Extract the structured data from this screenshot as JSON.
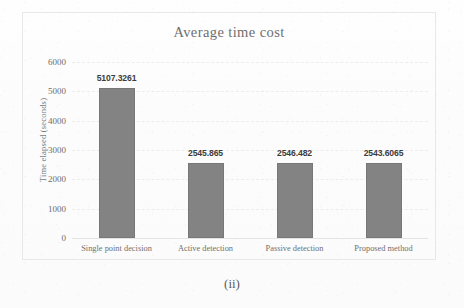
{
  "figure": {
    "caption": "(ii)"
  },
  "chart_data": {
    "type": "bar",
    "title": "Average time cost",
    "xlabel": "",
    "ylabel": "Time elapsed (seconds)",
    "categories": [
      "Single point decision",
      "Active detection",
      "Passive detection",
      "Proposed method"
    ],
    "values": [
      5107.3261,
      2545.865,
      2546.482,
      2543.6065
    ],
    "value_labels": [
      "5107.3261",
      "2545.865",
      "2546.482",
      "2543.6065"
    ],
    "ylim": [
      0,
      6000
    ],
    "yticks": [
      0,
      1000,
      2000,
      3000,
      4000,
      5000,
      6000
    ],
    "ytick_labels": [
      "0",
      "1000",
      "2000",
      "3000",
      "4000",
      "5000",
      "6000"
    ],
    "grid": true,
    "legend": null,
    "bar_color": "#838383",
    "bar_border_color": "#777777",
    "title_color": "#6f6f6f",
    "label_color": "#3c3c3c",
    "gridline_color": "#ededed"
  }
}
